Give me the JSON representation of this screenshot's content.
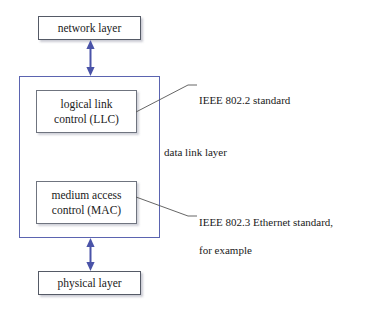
{
  "diagram": {
    "background_color": "#ffffff",
    "container_border_color": "#5b64b0",
    "box_border_color": "#555a66",
    "arrow_color": "#4a53a8",
    "leader_color": "#555555",
    "text_color": "#1a1a1a"
  },
  "boxes": {
    "network_layer": {
      "label": "network layer"
    },
    "physical_layer": {
      "label": "physical layer"
    },
    "llc": {
      "line1": "logical link",
      "line2": "control (LLC)"
    },
    "mac": {
      "line1": "medium access",
      "line2": "control (MAC)"
    }
  },
  "container": {
    "label": "data link layer"
  },
  "callouts": {
    "llc_standard": "IEEE 802.2 standard",
    "mac_standard_line1": "IEEE 802.3 Ethernet standard,",
    "mac_standard_line2": "for example"
  },
  "arrows": {
    "top": {
      "name": "network-to-datalink-arrow",
      "direction": "bidirectional"
    },
    "bottom": {
      "name": "datalink-to-physical-arrow",
      "direction": "bidirectional"
    }
  }
}
